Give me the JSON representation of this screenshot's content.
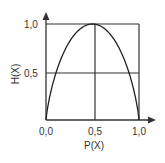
{
  "chart_data": {
    "type": "line",
    "title": "",
    "xlabel": "P(X)",
    "ylabel": "H(X)",
    "xlim": [
      0,
      1
    ],
    "ylim": [
      0,
      1
    ],
    "x_ticks": [
      "0,0",
      "0,5",
      "1,0"
    ],
    "y_ticks": [
      "0,5",
      "1,0"
    ],
    "grid": "lines at x=0.5 and y=0.5, box at x=1 and y=1",
    "series": [
      {
        "name": "H(X)",
        "x": [
          0.0,
          0.05,
          0.1,
          0.2,
          0.3,
          0.4,
          0.5,
          0.6,
          0.7,
          0.8,
          0.9,
          0.95,
          1.0
        ],
        "values": [
          0.0,
          0.29,
          0.47,
          0.72,
          0.88,
          0.97,
          1.0,
          0.97,
          0.88,
          0.72,
          0.47,
          0.29,
          0.0
        ]
      }
    ]
  }
}
